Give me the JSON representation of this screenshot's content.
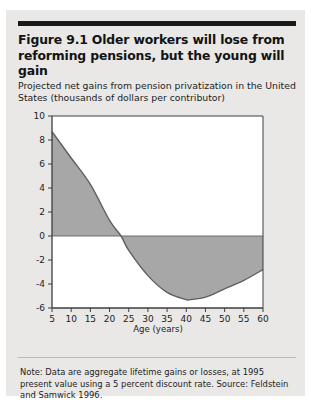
{
  "figure": {
    "title": "Figure 9.1  Older workers will lose from reforming pensions, but the young will gain",
    "subtitle": "Projected net gains from pension privatization in the United States (thousands of dollars per contributor)",
    "note": "Note: Data are aggregate lifetime gains or losses, at 1995 present value using a 5 percent discount rate. Source: Feldstein and Samwick 1996."
  },
  "colors": {
    "page_background": "#e9e8e6",
    "plot_background": "#ffffff",
    "area_fill": "#a7a7a7",
    "curve_line": "#5f5f5f",
    "axis": "#3c3e40",
    "rule": "#17191a",
    "text": "#1b1d1f"
  },
  "chart_data": {
    "type": "area",
    "title": "Projected net gains from pension privatization in the United States (thousands of dollars per contributor)",
    "xlabel": "Age (years)",
    "ylabel": "",
    "xlim": [
      5,
      60
    ],
    "ylim": [
      -6,
      10
    ],
    "grid": false,
    "legend": null,
    "baseline": 0,
    "x_ticks": [
      5,
      10,
      15,
      20,
      25,
      30,
      35,
      40,
      45,
      50,
      55,
      60
    ],
    "y_ticks": [
      10,
      8,
      6,
      4,
      2,
      0,
      -2,
      -4,
      -6
    ],
    "x_tick_labels": [
      "5",
      "10",
      "15",
      "20",
      "25",
      "30",
      "35",
      "40",
      "45",
      "50",
      "55",
      "60"
    ],
    "y_tick_labels": [
      "10",
      "8",
      "6",
      "4",
      "2",
      "0",
      "-2",
      "-4",
      "-6"
    ],
    "zero_crossing_age": 23,
    "minimum": {
      "age": 41,
      "value": -5.3
    },
    "series": [
      {
        "name": "Net gain from pension privatization",
        "x": [
          5,
          10,
          15,
          20,
          23,
          25,
          30,
          35,
          40,
          41,
          45,
          50,
          55,
          60
        ],
        "values": [
          8.7,
          6.5,
          4.3,
          1.3,
          0.0,
          -1.2,
          -3.3,
          -4.7,
          -5.3,
          -5.3,
          -5.1,
          -4.4,
          -3.7,
          -2.8
        ]
      }
    ]
  }
}
